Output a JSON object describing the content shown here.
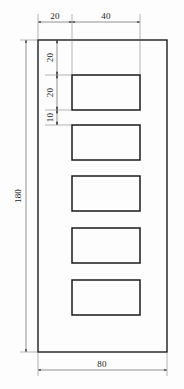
{
  "drawing": {
    "title": "perforated-plate-elevation",
    "units_note": "",
    "colors": {
      "background": "#fdfdfd",
      "outline": "#1a1a1a",
      "dimension": "#4a4a4a",
      "text": "#1c1c1c"
    }
  },
  "dimensions": {
    "top_left_offset": "20",
    "top_slot_width": "40",
    "left_first": "20",
    "left_second": "20",
    "left_third": "10",
    "overall_height": "180",
    "overall_width": "80"
  },
  "geometry": {
    "plate": {
      "label": "plate-outline",
      "x": 38,
      "y": 40,
      "width": 129,
      "height": 312
    },
    "slots": [
      {
        "label": "slot-1",
        "x": 72,
        "y": 75,
        "width": 68,
        "height": 35
      },
      {
        "label": "slot-2",
        "x": 72,
        "y": 125,
        "width": 68,
        "height": 35
      },
      {
        "label": "slot-3",
        "x": 72,
        "y": 176,
        "width": 68,
        "height": 35
      },
      {
        "label": "slot-4",
        "x": 72,
        "y": 228,
        "width": 68,
        "height": 35
      },
      {
        "label": "slot-5",
        "x": 72,
        "y": 280,
        "width": 68,
        "height": 35
      }
    ]
  },
  "chart_data": {
    "type": "table",
    "categories": [
      "overall width",
      "overall height",
      "edge offset",
      "slot width",
      "slot height",
      "gap between slots"
    ],
    "values": [
      80,
      180,
      20,
      40,
      20,
      10
    ],
    "xlabel": "feature",
    "ylabel": "millimetres",
    "annotations": [
      "20",
      "40",
      "20",
      "20",
      "10",
      "180",
      "80"
    ]
  }
}
